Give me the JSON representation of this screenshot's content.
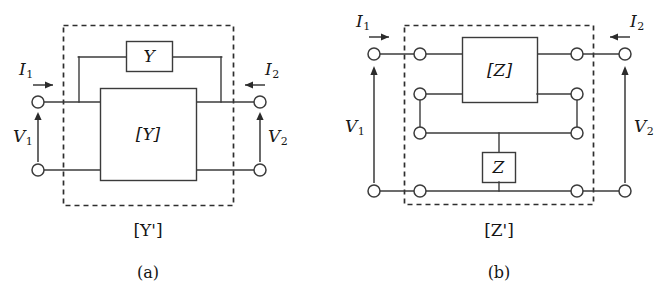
{
  "figure": {
    "type": "circuit-diagram",
    "panels": [
      {
        "id": "a",
        "caption": "(a)",
        "enclosure_label": "[Y']",
        "inner_block_label": "[Y]",
        "parallel_element_label": "Y",
        "ports": {
          "left": {
            "current_label": "I",
            "current_subscript": "1",
            "voltage_label": "V",
            "voltage_subscript": "1",
            "current_direction": "right",
            "voltage_direction": "up"
          },
          "right": {
            "current_label": "I",
            "current_subscript": "2",
            "voltage_label": "V",
            "voltage_subscript": "2",
            "current_direction": "left",
            "voltage_direction": "up"
          }
        }
      },
      {
        "id": "b",
        "caption": "(b)",
        "enclosure_label": "[Z']",
        "inner_block_label": "[Z]",
        "series_element_label": "Z",
        "ports": {
          "left": {
            "current_label": "I",
            "current_subscript": "1",
            "voltage_label": "V",
            "voltage_subscript": "1",
            "current_direction": "right",
            "voltage_direction": "up"
          },
          "right": {
            "current_label": "I",
            "current_subscript": "2",
            "voltage_label": "V",
            "voltage_subscript": "2",
            "current_direction": "left",
            "voltage_direction": "up"
          }
        }
      }
    ]
  },
  "colors": {
    "line": "#3b3b3b",
    "dash": "#2e2e2e",
    "text": "#151515",
    "background": "#ffffff"
  },
  "brackets": {
    "open": "[",
    "close": "]"
  }
}
